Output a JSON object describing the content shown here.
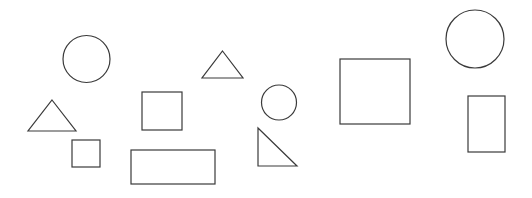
{
  "canvas": {
    "width": 532,
    "height": 198,
    "background_color": "#ffffff",
    "stroke_color": "#3a3a3a",
    "stroke_width": 1.2,
    "fill": "none",
    "title": "Geometric shapes scatter",
    "shape_count": 11
  },
  "shapes": [
    {
      "id": "circle-large-left",
      "type": "circle",
      "label": "Circle",
      "cx": 86.5,
      "cy": 59,
      "r": 23.5,
      "width": 47,
      "height": 47
    },
    {
      "id": "triangle-left",
      "type": "triangle",
      "label": "Triangle",
      "points": "52,100 76,131 28,131",
      "x": 28,
      "y": 100,
      "width": 48,
      "height": 31
    },
    {
      "id": "square-small-left",
      "type": "square",
      "label": "Small square",
      "x": 72,
      "y": 140,
      "width": 28,
      "height": 27
    },
    {
      "id": "square-medium-center",
      "type": "square",
      "label": "Medium square",
      "x": 142,
      "y": 92,
      "width": 40,
      "height": 38
    },
    {
      "id": "rectangle-wide-bottom",
      "type": "rectangle",
      "label": "Wide rectangle",
      "x": 131,
      "y": 150,
      "width": 84,
      "height": 34
    },
    {
      "id": "triangle-top-center",
      "type": "triangle",
      "label": "Small triangle",
      "points": "222.5,51 243,78 202,78",
      "x": 202,
      "y": 51,
      "width": 41,
      "height": 27
    },
    {
      "id": "circle-small-center",
      "type": "circle",
      "label": "Small circle",
      "cx": 279,
      "cy": 102.5,
      "r": 17.5,
      "width": 35,
      "height": 35
    },
    {
      "id": "right-triangle-center",
      "type": "right-triangle",
      "label": "Right triangle",
      "points": "258,128 297,166 258,166",
      "x": 258,
      "y": 128,
      "width": 39,
      "height": 38
    },
    {
      "id": "square-large-right",
      "type": "square",
      "label": "Large square",
      "x": 340,
      "y": 59,
      "width": 70,
      "height": 65
    },
    {
      "id": "circle-large-topright",
      "type": "circle",
      "label": "Large circle",
      "cx": 475,
      "cy": 39,
      "r": 29,
      "width": 58,
      "height": 58
    },
    {
      "id": "rectangle-tall-right",
      "type": "rectangle",
      "label": "Tall rectangle",
      "x": 468,
      "y": 96,
      "width": 37,
      "height": 56
    }
  ]
}
